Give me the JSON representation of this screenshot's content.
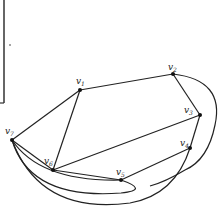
{
  "diagram": {
    "type": "graph",
    "vertices": [
      {
        "id": "v1",
        "label": "v",
        "sub": "1",
        "x": 80,
        "y": 90,
        "lx": 74,
        "ly": 82
      },
      {
        "id": "v2",
        "label": "v",
        "sub": "2",
        "x": 173,
        "y": 74,
        "lx": 168,
        "ly": 68
      },
      {
        "id": "v3",
        "label": "v",
        "sub": "3",
        "x": 200,
        "y": 115,
        "lx": 184,
        "ly": 113
      },
      {
        "id": "v4",
        "label": "v",
        "sub": "4",
        "x": 190,
        "y": 148,
        "lx": 180,
        "ly": 146
      },
      {
        "id": "v5",
        "label": "v",
        "sub": "5",
        "x": 121,
        "y": 180,
        "lx": 116,
        "ly": 174
      },
      {
        "id": "v6",
        "label": "v",
        "sub": "6",
        "x": 53,
        "y": 170,
        "lx": 44,
        "ly": 162
      },
      {
        "id": "v7",
        "label": "v",
        "sub": "7",
        "x": 12,
        "y": 140,
        "lx": 5,
        "ly": 133
      }
    ],
    "edges": [
      [
        "v1",
        "v2"
      ],
      [
        "v2",
        "v3"
      ],
      [
        "v3",
        "v4"
      ],
      [
        "v1",
        "v7"
      ],
      [
        "v1",
        "v6"
      ],
      [
        "v7",
        "v6"
      ],
      [
        "v6",
        "v3"
      ],
      [
        "v6",
        "v5"
      ],
      [
        "v5",
        "v4"
      ],
      [
        "v7",
        "v5",
        "curve"
      ],
      [
        "v7",
        "v5",
        "curve"
      ],
      [
        "v7",
        "v4",
        "curve"
      ],
      [
        "v2",
        "v4",
        "arc"
      ]
    ]
  }
}
